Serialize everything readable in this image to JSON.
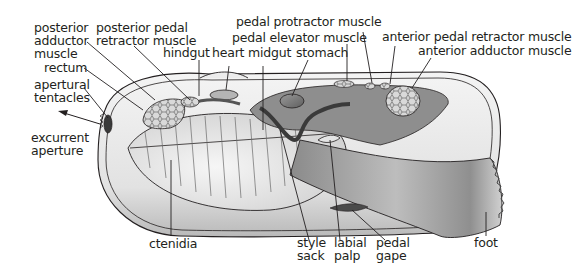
{
  "diagram": {
    "labels": {
      "posterior_adductor_muscle": "posterior\nadductor\nmuscle",
      "posterior_pedal_retractor_muscle": "posterior pedal\nretractor muscle",
      "hindgut": "hindgut",
      "heart": "heart",
      "midgut": "midgut",
      "stomach": "stomach",
      "pedal_protractor_muscle": "pedal protractor muscle",
      "pedal_elevator_muscle": "pedal elevator muscle",
      "anterior_pedal_retractor_muscle": "anterior pedal retractor muscle",
      "anterior_adductor_muscle": "anterior adductor muscle",
      "rectum": "rectum",
      "apertural_tentacles": "apertural\ntentacles",
      "excurrent_aperture": "excurrent\naperture",
      "ctenidia": "ctenidia",
      "style_sack": "style\nsack",
      "labial_palp": "labial\npalp",
      "pedal_gape": "pedal\ngape",
      "foot": "foot"
    },
    "colors": {
      "line": "#231f20",
      "tissue_dark": "#6d6d6d",
      "tissue_mid": "#a8a8a8",
      "tissue_light": "#e6e6e6"
    }
  }
}
